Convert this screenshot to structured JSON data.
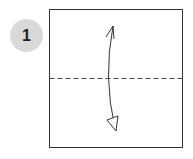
{
  "step": {
    "number": "1"
  },
  "diagram": {
    "paper_color": "#ffffff",
    "stroke_color": "#333333",
    "fold_line": "valley-fold-dashed-horizontal",
    "arrow": "fold-and-unfold-arrow"
  }
}
